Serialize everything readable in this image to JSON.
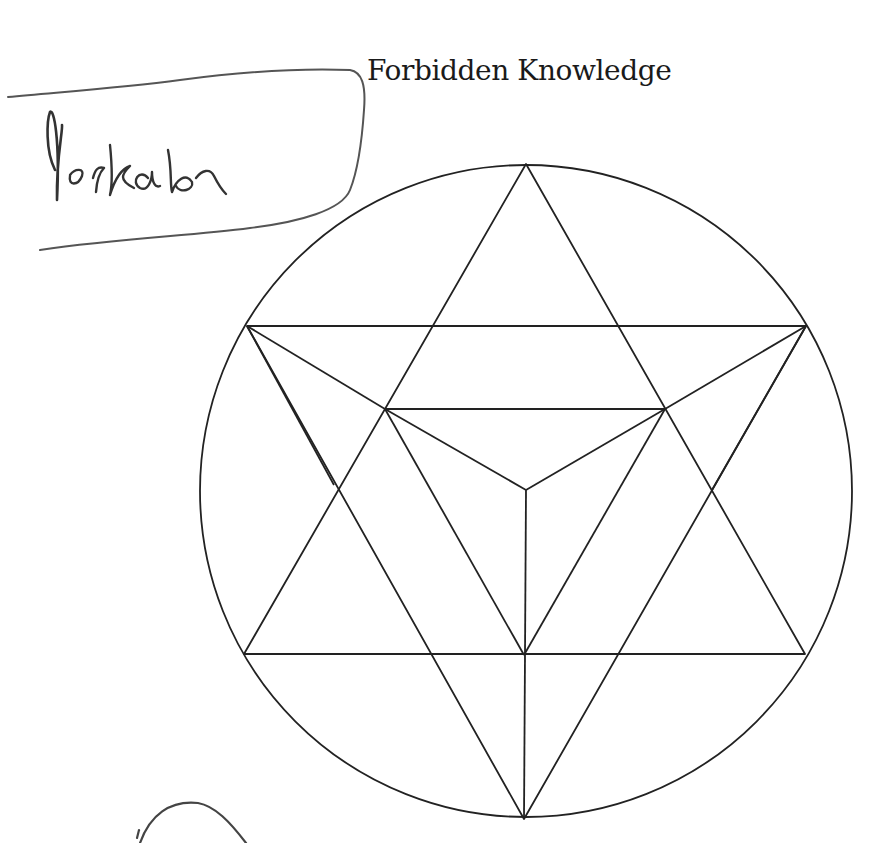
{
  "page": {
    "title": "Forbidden Knowledge",
    "handwritten_label": "Merkaba"
  },
  "figure": {
    "name": "Merkaba star tetrahedron in circle",
    "stroke_color": "#222222",
    "pencil_color": "#555555"
  }
}
